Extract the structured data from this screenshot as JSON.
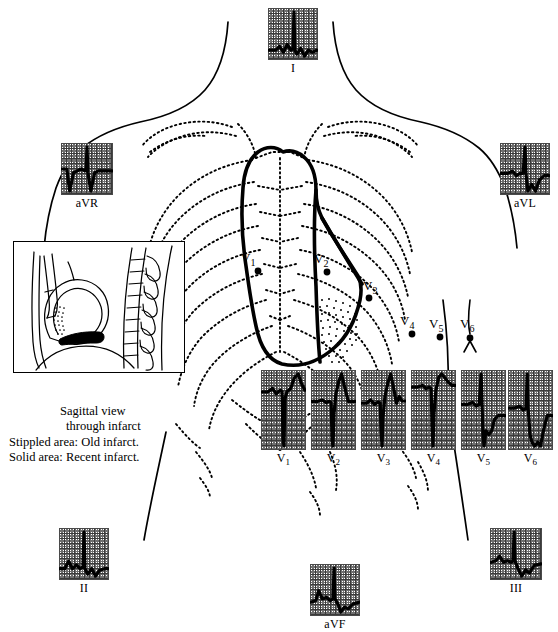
{
  "figure": {
    "ink_color": "#000000",
    "grid_color": "#6f6f6f"
  },
  "inset": {
    "name": "sagittal-view-inset",
    "caption_line1": "Sagittal view",
    "caption_line2": "through infarct",
    "legend_line1": "Stippled area:  Old infarct.",
    "legend_line2": "Solid area:  Recent infarct."
  },
  "electrodes": [
    {
      "id": "V1",
      "label": "V",
      "sub": "1",
      "x": 258,
      "y": 271,
      "lx": 243,
      "ly": 252
    },
    {
      "id": "V2",
      "label": "V",
      "sub": "2",
      "x": 327,
      "y": 272,
      "lx": 316,
      "ly": 253
    },
    {
      "id": "V3",
      "label": "V",
      "sub": "3",
      "x": 369,
      "y": 298,
      "lx": 365,
      "ly": 281
    },
    {
      "id": "V4",
      "label": "V",
      "sub": "4",
      "x": 412,
      "y": 334,
      "lx": 402,
      "ly": 316
    },
    {
      "id": "V5",
      "label": "V",
      "sub": "5",
      "x": 440,
      "y": 337,
      "lx": 431,
      "ly": 319
    },
    {
      "id": "V6",
      "label": "V",
      "sub": "6",
      "x": 470,
      "y": 338,
      "lx": 462,
      "ly": 319
    }
  ],
  "leads": {
    "limb": [
      {
        "id": "I",
        "label": "I",
        "sub": "",
        "x": 268,
        "y": 8,
        "w": 50,
        "h": 52
      },
      {
        "id": "aVR",
        "label": "aVR",
        "sub": "",
        "x": 61,
        "y": 143,
        "w": 52,
        "h": 52
      },
      {
        "id": "aVL",
        "label": "aVL",
        "sub": "",
        "x": 500,
        "y": 143,
        "w": 50,
        "h": 52
      },
      {
        "id": "II",
        "label": "II",
        "sub": "",
        "x": 59,
        "y": 528,
        "w": 50,
        "h": 52
      },
      {
        "id": "aVF",
        "label": "aVF",
        "sub": "",
        "x": 310,
        "y": 564,
        "w": 50,
        "h": 52
      },
      {
        "id": "III",
        "label": "III",
        "sub": "",
        "x": 490,
        "y": 528,
        "w": 52,
        "h": 52
      }
    ],
    "precordial": [
      {
        "id": "V1",
        "label": "V",
        "sub": "1",
        "x": 261,
        "y": 370,
        "w": 45,
        "h": 80
      },
      {
        "id": "V2",
        "label": "V",
        "sub": "2",
        "x": 311,
        "y": 370,
        "w": 45,
        "h": 80
      },
      {
        "id": "V3",
        "label": "V",
        "sub": "3",
        "x": 361,
        "y": 370,
        "w": 45,
        "h": 80
      },
      {
        "id": "V4",
        "label": "V",
        "sub": "4",
        "x": 411,
        "y": 370,
        "w": 45,
        "h": 80
      },
      {
        "id": "V5",
        "label": "V",
        "sub": "5",
        "x": 461,
        "y": 370,
        "w": 45,
        "h": 80
      },
      {
        "id": "V6",
        "label": "V",
        "sub": "6",
        "x": 508,
        "y": 370,
        "w": 45,
        "h": 80
      }
    ]
  },
  "chart_data": {
    "type": "line",
    "xlabel": "time",
    "ylabel": "amplitude (mV)",
    "grid": true,
    "legend_position": "none",
    "series": [
      {
        "name": "I",
        "points": "0,30 7,30 11,28 15,31 19,27 23,30 25,29 26,10 27,30 29,32 33,29 37,33 41,30 45,31 50,30"
      },
      {
        "name": "aVR",
        "points": "0,22 5,22 8,34 12,24 16,23 20,22 24,23 25,22 26,10 27,24 30,34 34,24 38,23 44,23 52,23"
      },
      {
        "name": "aVL",
        "points": "0,26 7,26 12,25 16,27 20,26 23,26 25,14 26,26 28,34 32,31 36,34 40,29 45,27 50,27"
      },
      {
        "name": "II",
        "points": "0,30 5,30 9,26 13,30 17,28 21,30 24,29 25,10 26,30 29,33 33,30 37,34 41,31 46,30 50,30"
      },
      {
        "name": "aVF",
        "points": "0,30 5,29 8,23 12,28 16,27 20,29 23,28 24,9 25,28 28,31 31,36 35,33 39,34 44,31 50,30"
      },
      {
        "name": "III",
        "points": "0,28 5,27 9,24 13,28 17,27 21,28 23,27 24,8 25,27 28,32 32,37 36,33 40,35 45,30 52,29"
      },
      {
        "name": "V1",
        "points": "0,36 6,36 11,34 15,37 19,35 21,36 22,62 23,66 24,40 26,36 30,34 34,28 38,26 41,31 45,35 45,35"
      },
      {
        "name": "V2",
        "points": "0,40 6,40 11,39 15,41 18,40 20,41 21,72 22,76 23,50 25,34 28,24 31,18 34,28 38,40 42,40 45,40"
      },
      {
        "name": "V3",
        "points": "0,34 5,34 9,31 13,35 17,33 19,34 20,60 21,72 22,46 24,28 27,16 30,8 33,20 36,34 39,28 42,32 45,32"
      },
      {
        "name": "V4",
        "points": "0,36 6,36 11,35 15,37 18,36 20,37 21,60 22,72 23,52 25,38 28,30 31,28 34,30 38,33 42,35 45,35"
      },
      {
        "name": "V5",
        "points": "0,30 6,30 11,29 15,31 18,30 20,14 21,30 22,46 23,52 25,44 28,46 31,44 34,38 38,36 42,36 45,36"
      },
      {
        "name": "V6",
        "points": "0,30 6,30 11,29 15,31 18,30 19,12 20,30 22,44 24,48 27,50 30,48 33,50 36,42 40,34 45,34"
      }
    ]
  }
}
